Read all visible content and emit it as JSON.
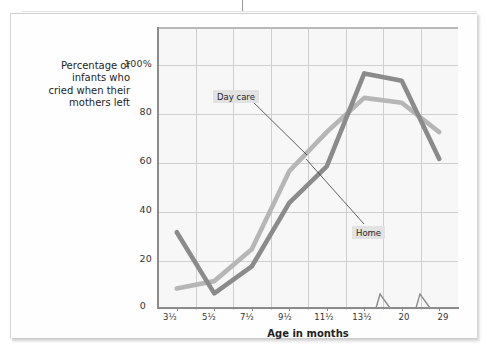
{
  "chart_data": {
    "type": "line",
    "title": "",
    "xlabel": "Age in months",
    "ylabel": "Percentage of infants who cried when their mothers left",
    "categories": [
      "3½",
      "5½",
      "7½",
      "9½",
      "11½",
      "13½",
      "20",
      "29"
    ],
    "ytick_labels": [
      "0",
      "20",
      "40",
      "60",
      "80",
      "100%"
    ],
    "ytick_values": [
      0,
      20,
      40,
      60,
      80,
      100
    ],
    "ylim": [
      0,
      115
    ],
    "grid": true,
    "legend_position": "inline-callout",
    "axis_breaks": [
      "between 13½ and 20",
      "between 20 and 29"
    ],
    "series": [
      {
        "name": "Day care",
        "color": "#b6b6b6",
        "values": [
          8,
          11,
          24,
          56,
          72,
          86,
          84,
          72
        ]
      },
      {
        "name": "Home",
        "color": "#8b8b8b",
        "values": [
          31,
          6,
          17,
          43,
          58,
          96,
          93,
          61
        ]
      }
    ]
  },
  "labels": {
    "y_axis_caption": "Percentage of infants who cried when their mothers left",
    "y_axis_caption_lines": [
      "Percentage of",
      "infants who",
      "cried when their",
      "mothers left"
    ],
    "x_axis_caption": "Age in months",
    "callout_daycare": "Day care",
    "callout_home": "Home"
  },
  "colors": {
    "daycare_line": "#b6b6b6",
    "home_line": "#8b8b8b",
    "plot_background": "#f7f7f7",
    "gridline": "#cfcfcf",
    "axis": "#8c8c8c",
    "text": "#1f1f1f",
    "callout_background": "#e2e2e2"
  }
}
